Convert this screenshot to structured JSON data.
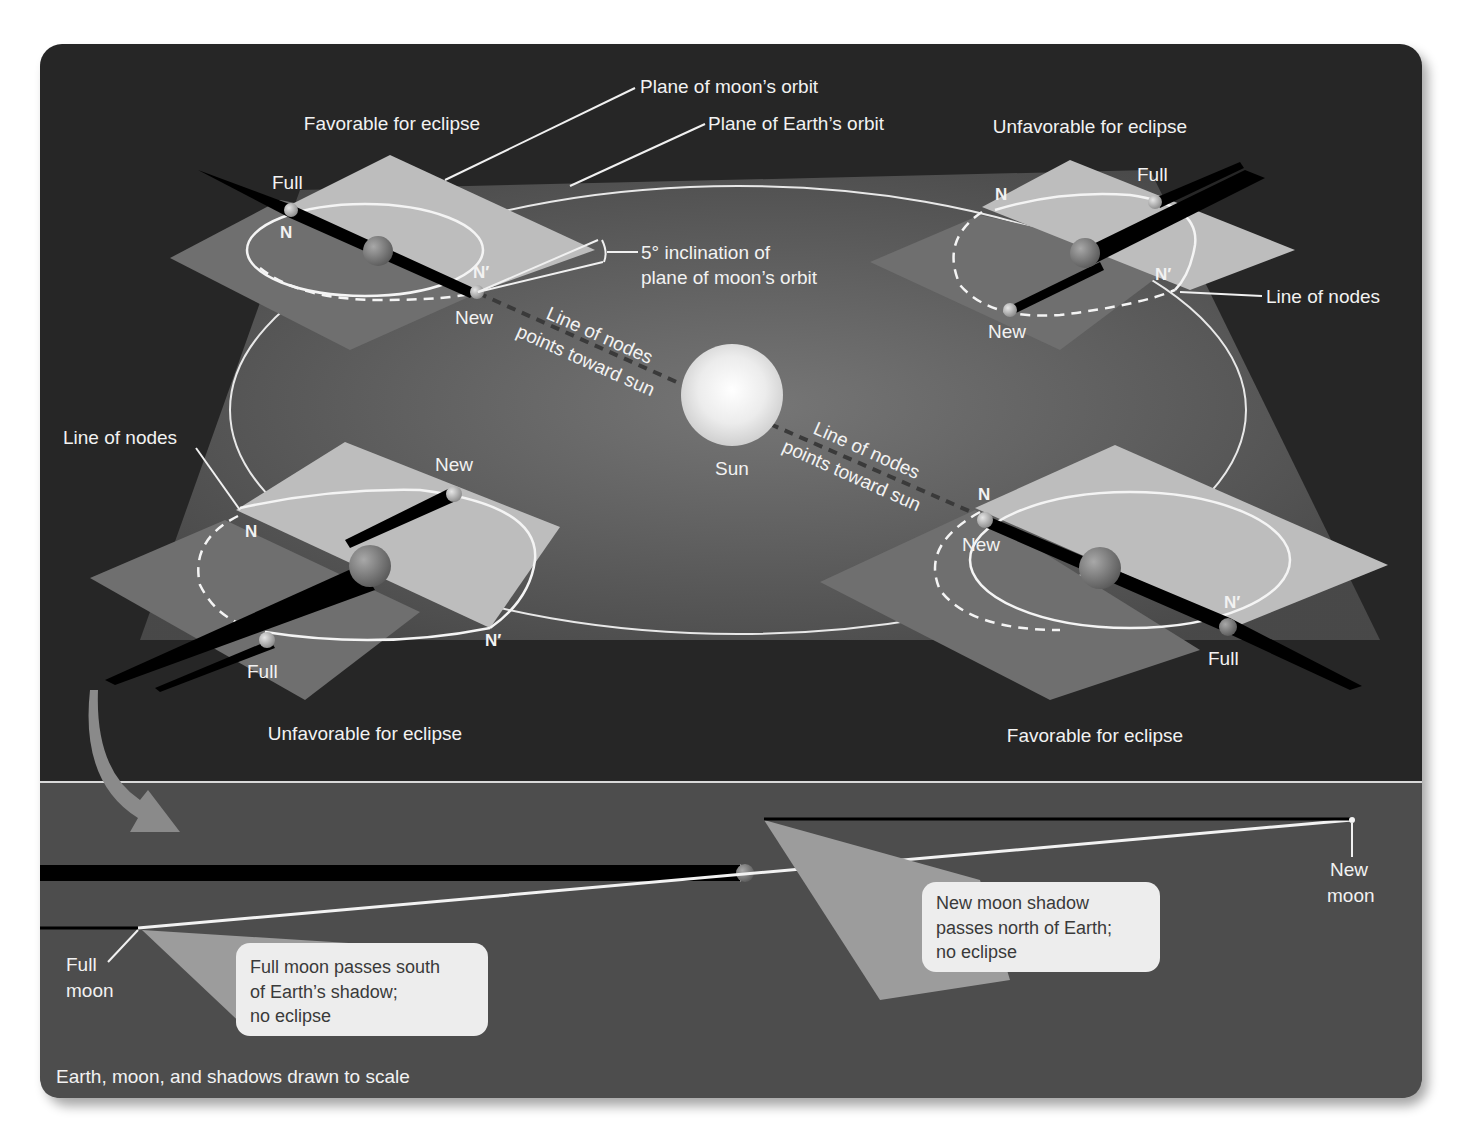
{
  "figure": {
    "domain": "eclipse-geometry-diagram",
    "colors": {
      "panel_bg": "#262626",
      "lower_panel_bg": "#505050",
      "earth_orbit_plane": "#5c5c5c",
      "moon_orbit_plane_light": "#bdbdbd",
      "moon_orbit_plane_dark": "#6f6f6f",
      "shadow": "#000000",
      "sun": "#e8e8e8",
      "label": "#f2f2f2",
      "callout_bg": "#ededed",
      "divider": "#d9d9d9"
    }
  },
  "top": {
    "plane_moon_orbit": "Plane of moon’s orbit",
    "plane_earth_orbit": "Plane of Earth’s orbit",
    "inclination_line1": "5° inclination of",
    "inclination_line2": "plane of moon’s orbit",
    "sun": "Sun",
    "line_of_nodes_points_1": "Line of nodes",
    "line_of_nodes_points_2": "points toward sun",
    "positions": {
      "top_left": {
        "heading": "Favorable for eclipse",
        "full": "Full",
        "new": "New",
        "node_n": "N",
        "node_n_prime": "N′"
      },
      "top_right": {
        "heading": "Unfavorable for eclipse",
        "full": "Full",
        "new": "New",
        "node_n": "N",
        "node_n_prime": "N′",
        "line_of_nodes": "Line of nodes"
      },
      "bottom_left": {
        "heading": "Unfavorable for eclipse",
        "full": "Full",
        "new": "New",
        "node_n": "N",
        "node_n_prime": "N′",
        "line_of_nodes": "Line of nodes"
      },
      "bottom_right": {
        "heading": "Favorable for eclipse",
        "full": "Full",
        "new": "New",
        "node_n": "N",
        "node_n_prime": "N′"
      }
    }
  },
  "bottom": {
    "full_moon_1": "Full",
    "full_moon_2": "moon",
    "new_moon_1": "New",
    "new_moon_2": "moon",
    "callout_full": [
      "Full moon passes south",
      "of Earth’s shadow;",
      "no eclipse"
    ],
    "callout_new": [
      "New moon shadow",
      "passes north of Earth;",
      "no eclipse"
    ],
    "scale_note": "Earth, moon, and shadows drawn to scale"
  }
}
